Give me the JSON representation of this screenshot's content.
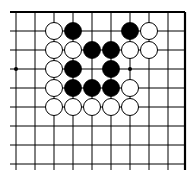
{
  "diagram": {
    "type": "go-board-fragment",
    "grid": {
      "x_lines": [
        16,
        35,
        54,
        73,
        92,
        111,
        130,
        149,
        168,
        185
      ],
      "y_lines": [
        12,
        31,
        50,
        69,
        88,
        107,
        126,
        145,
        164
      ],
      "left_extent": 10,
      "bottom_extent": 170,
      "top_edge": true,
      "right_edge": true,
      "line_color": "#000000"
    },
    "stone_radius": 8.5,
    "star_points": [
      {
        "col": 0,
        "row": 3
      },
      {
        "col": 6,
        "row": 3
      }
    ],
    "stones": [
      {
        "col": 2,
        "row": 1,
        "color": "white"
      },
      {
        "col": 3,
        "row": 1,
        "color": "black"
      },
      {
        "col": 6,
        "row": 1,
        "color": "black"
      },
      {
        "col": 7,
        "row": 1,
        "color": "white"
      },
      {
        "col": 2,
        "row": 2,
        "color": "white"
      },
      {
        "col": 3,
        "row": 2,
        "color": "white"
      },
      {
        "col": 4,
        "row": 2,
        "color": "black"
      },
      {
        "col": 5,
        "row": 2,
        "color": "black"
      },
      {
        "col": 6,
        "row": 2,
        "color": "white"
      },
      {
        "col": 7,
        "row": 2,
        "color": "white"
      },
      {
        "col": 2,
        "row": 3,
        "color": "white"
      },
      {
        "col": 3,
        "row": 3,
        "color": "black"
      },
      {
        "col": 5,
        "row": 3,
        "color": "black"
      },
      {
        "col": 2,
        "row": 4,
        "color": "white"
      },
      {
        "col": 3,
        "row": 4,
        "color": "black"
      },
      {
        "col": 4,
        "row": 4,
        "color": "black"
      },
      {
        "col": 5,
        "row": 4,
        "color": "black"
      },
      {
        "col": 6,
        "row": 4,
        "color": "white"
      },
      {
        "col": 2,
        "row": 5,
        "color": "white"
      },
      {
        "col": 3,
        "row": 5,
        "color": "white"
      },
      {
        "col": 4,
        "row": 5,
        "color": "white"
      },
      {
        "col": 5,
        "row": 5,
        "color": "white"
      },
      {
        "col": 6,
        "row": 5,
        "color": "white"
      }
    ],
    "colors": {
      "black_stone": "#000000",
      "white_stone_fill": "#ffffff",
      "white_stone_stroke": "#000000",
      "background": "#ffffff"
    }
  }
}
